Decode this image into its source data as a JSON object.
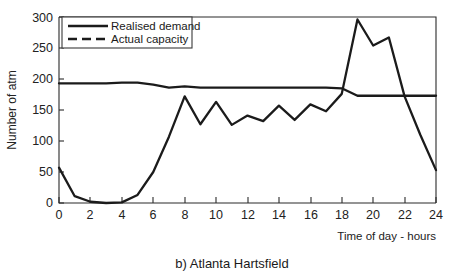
{
  "chart_data": {
    "type": "line",
    "title": "",
    "caption": "b) Atlanta Hartsfield",
    "xlabel": "Time of day - hours",
    "ylabel": "Number of atm",
    "xlim": [
      0,
      24
    ],
    "ylim": [
      0,
      300
    ],
    "grid": false,
    "legend_position": "top-left-inside",
    "x_ticks": [
      0,
      2,
      4,
      6,
      8,
      10,
      12,
      14,
      16,
      18,
      20,
      22,
      24
    ],
    "x_tick_labels": [
      "0",
      "2",
      "4",
      "6",
      "8",
      "10",
      "12",
      "14",
      "16",
      "18",
      "20",
      "22",
      "24"
    ],
    "x_minor_ticks": [
      1,
      3,
      5,
      7,
      9,
      11,
      13,
      15,
      17,
      19,
      21,
      23
    ],
    "y_ticks": [
      0,
      50,
      100,
      150,
      200,
      250,
      300
    ],
    "y_tick_labels": [
      "0",
      "50",
      "100",
      "150",
      "200",
      "250",
      "300"
    ],
    "x": [
      0,
      1,
      2,
      3,
      4,
      5,
      6,
      7,
      8,
      9,
      10,
      11,
      12,
      13,
      14,
      15,
      16,
      17,
      18,
      19,
      20,
      21,
      22,
      23,
      24
    ],
    "series": [
      {
        "name": "Realised demand",
        "style": "solid",
        "color": "#1b1b1b",
        "values": [
          57,
          11,
          2,
          0,
          1,
          13,
          50,
          107,
          172,
          127,
          163,
          126,
          141,
          132,
          157,
          134,
          159,
          148,
          176,
          296,
          254,
          267,
          172,
          110,
          53
        ]
      },
      {
        "name": "Actual capacity",
        "style": "dashed",
        "color": "#1b1b1b",
        "values": [
          193,
          193,
          193,
          193,
          194,
          194,
          191,
          186,
          188,
          186,
          186,
          186,
          186,
          186,
          186,
          186,
          186,
          186,
          185,
          173,
          173,
          173,
          173,
          173,
          173
        ]
      }
    ],
    "legend": [
      "Realised demand",
      "Actual capacity"
    ]
  },
  "axes": {
    "y_axis_title": "Number of atm",
    "x_axis_title": "Time of day - hours"
  },
  "figure": {
    "caption": "b) Atlanta Hartsfield"
  }
}
